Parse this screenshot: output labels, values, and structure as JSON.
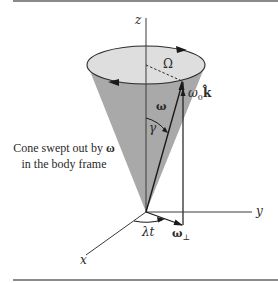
{
  "figure": {
    "axes": {
      "z": "z",
      "y": "y",
      "x": "x"
    },
    "labels": {
      "omega_cap_Omega": "Ω",
      "omega0k": "ω",
      "omega0k_sub": "0",
      "omega0k_vec": "k̂",
      "omega": "ω",
      "gamma": "γ",
      "lambda_t": "λt",
      "omega_perp": "ω",
      "omega_perp_sub": "⊥"
    },
    "caption": {
      "line1_text": "Cone swept out by ",
      "line1_symbol": "ω",
      "line2": "in the body frame"
    },
    "colors": {
      "cone_fill": "#a9a9a9",
      "cone_top_fill": "#dedede",
      "line": "#2a2a2a",
      "rule": "#8a8a8a"
    }
  }
}
